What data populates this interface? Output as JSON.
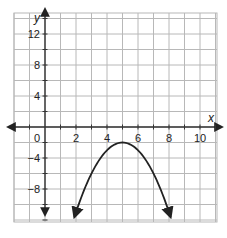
{
  "chart_data": {
    "type": "line",
    "title": "",
    "xlabel": "x",
    "ylabel": "y",
    "function": "y = -(x - 5)^2 - 2",
    "vertex": [
      5,
      -2
    ],
    "xlim": [
      -2,
      11
    ],
    "ylim": [
      -12,
      14
    ],
    "x_grid_step": 1,
    "y_grid_step": 2,
    "grid": true,
    "x_ticks": [
      {
        "value": 0,
        "label": "0"
      },
      {
        "value": 2,
        "label": "2"
      },
      {
        "value": 4,
        "label": "4"
      },
      {
        "value": 6,
        "label": "6"
      },
      {
        "value": 8,
        "label": "8"
      },
      {
        "value": 10,
        "label": "10"
      }
    ],
    "y_ticks": [
      {
        "value": 12,
        "label": "12"
      },
      {
        "value": 8,
        "label": "8"
      },
      {
        "value": 4,
        "label": "4"
      },
      {
        "value": -4,
        "label": "−4"
      },
      {
        "value": -8,
        "label": "−8"
      }
    ],
    "series": [
      {
        "name": "parabola",
        "x": [
          1.9,
          2.5,
          3,
          3.5,
          4,
          4.5,
          5,
          5.5,
          6,
          6.5,
          7,
          7.5,
          8.1
        ],
        "y": [
          -11.6,
          -8.25,
          -6,
          -4.25,
          -3,
          -2.25,
          -2,
          -2.25,
          -3,
          -4.25,
          -6,
          -8.25,
          -11.6
        ],
        "arrows_at_ends": true
      }
    ]
  },
  "colors": {
    "grid": "#b8b8b8",
    "axis": "#333333",
    "curve": "#222222",
    "background": "#ffffff"
  }
}
